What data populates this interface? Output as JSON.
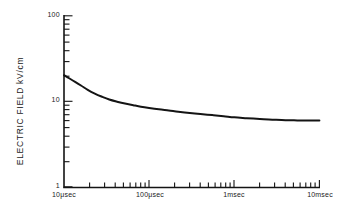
{
  "chart_data": {
    "type": "line",
    "title": "",
    "xlabel": "",
    "ylabel": "ELECTRIC  FIELD  kV/cm",
    "xscale": "log",
    "yscale": "log",
    "xlim": [
      1e-05,
      0.01
    ],
    "ylim": [
      1,
      100
    ],
    "grid": false,
    "legend": null,
    "x_unit": "seconds",
    "y_unit": "kV/cm",
    "xtick_labels": [
      "10μsec",
      "100μsec",
      "1msec",
      "10msec"
    ],
    "xtick_values": [
      1e-05,
      0.0001,
      0.001,
      0.01
    ],
    "ytick_labels": [
      "100",
      "10",
      "1"
    ],
    "ytick_values": [
      100,
      10,
      1
    ],
    "series": [
      {
        "name": "breakdown-field",
        "x": [
          1e-05,
          1.15e-05,
          1.35e-05,
          1.6e-05,
          1.9e-05,
          2.3e-05,
          2.8e-05,
          3.4e-05,
          4.2e-05,
          5.2e-05,
          6.5e-05,
          8e-05,
          0.0001,
          0.00013,
          0.00017,
          0.00022,
          0.0003,
          0.0004,
          0.00055,
          0.00075,
          0.001,
          0.0014,
          0.002,
          0.0028,
          0.004,
          0.0055,
          0.0075,
          0.01
        ],
        "y": [
          20.2,
          18.6,
          16.9,
          15.2,
          13.6,
          12.3,
          11.3,
          10.5,
          9.9,
          9.4,
          9.0,
          8.65,
          8.35,
          8.05,
          7.8,
          7.55,
          7.3,
          7.1,
          6.9,
          6.7,
          6.5,
          6.35,
          6.2,
          6.1,
          6.0,
          5.98,
          5.97,
          5.97
        ]
      }
    ],
    "annotations": []
  },
  "axes": {
    "y_axis_name": "electric-field-axis",
    "x_axis_name": "time-axis"
  }
}
